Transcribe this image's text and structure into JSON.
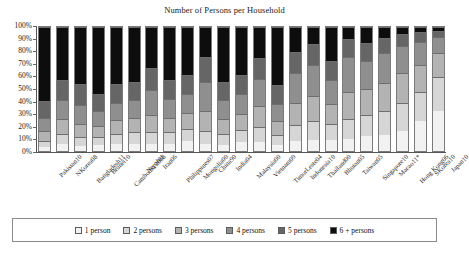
{
  "chart_data": {
    "type": "bar",
    "subtype": "stacked-100-percent",
    "title": "Number of Persons per Household",
    "xlabel": "",
    "ylabel": "",
    "ylim": [
      0,
      100
    ],
    "ytick_labels": [
      "0%",
      "10%",
      "20%",
      "30%",
      "40%",
      "50%",
      "60%",
      "70%",
      "80%",
      "90%",
      "100%"
    ],
    "ytick_values": [
      0,
      10,
      20,
      30,
      40,
      50,
      60,
      70,
      80,
      90,
      100
    ],
    "grid": false,
    "legend_position": "bottom",
    "categories": [
      "Pakistan10",
      "NKorea08",
      "Bangladesh11",
      "Brunei10",
      "Cambodia 2008",
      "Nepal01",
      "Iran06",
      "Philippines07",
      "Mongolia00",
      "China90",
      "India04",
      "Malaysia00",
      "Vietnam09",
      "TimorLeste04",
      "Indonesia10",
      "Thailand00",
      "Bhutan05",
      "Taiwan05",
      "Singapore10",
      "Macao11*",
      "Hong Kong06",
      "SKorea10",
      "Japan10"
    ],
    "series": [
      {
        "name": "1 person",
        "color": "#f2f2f2",
        "values": [
          3,
          6,
          4,
          5,
          6,
          6,
          6,
          6,
          8,
          6,
          5,
          7,
          7,
          5,
          8,
          9,
          9,
          10,
          12,
          13,
          16,
          24,
          32
        ]
      },
      {
        "name": "2 persons",
        "color": "#d6d6d6",
        "values": [
          5,
          8,
          7,
          6,
          8,
          9,
          9,
          9,
          10,
          10,
          9,
          10,
          12,
          8,
          13,
          15,
          13,
          16,
          17,
          19,
          23,
          24,
          28
        ]
      },
      {
        "name": "3 persons",
        "color": "#b3b3b3",
        "values": [
          8,
          12,
          11,
          9,
          11,
          12,
          14,
          12,
          13,
          16,
          12,
          13,
          17,
          11,
          18,
          20,
          16,
          22,
          21,
          23,
          24,
          21,
          19
        ]
      },
      {
        "name": "4 persons",
        "color": "#8f8f8f",
        "values": [
          11,
          15,
          15,
          12,
          14,
          14,
          20,
          15,
          15,
          24,
          15,
          16,
          22,
          14,
          24,
          25,
          19,
          28,
          23,
          24,
          22,
          19,
          13
        ]
      },
      {
        "name": "5 persons",
        "color": "#666666",
        "values": [
          13,
          16,
          17,
          14,
          15,
          15,
          18,
          15,
          15,
          20,
          15,
          15,
          17,
          15,
          17,
          17,
          16,
          14,
          14,
          12,
          9,
          8,
          5
        ]
      },
      {
        "name": "6 + persons",
        "color": "#0d0d0d",
        "values": [
          60,
          43,
          46,
          54,
          46,
          44,
          33,
          43,
          39,
          24,
          44,
          39,
          25,
          47,
          20,
          14,
          27,
          10,
          13,
          9,
          6,
          4,
          3
        ]
      }
    ],
    "legend_entries": [
      {
        "label": "1 person",
        "color": "#f2f2f2"
      },
      {
        "label": "2 persons",
        "color": "#d6d6d6"
      },
      {
        "label": "3 persons",
        "color": "#b3b3b3"
      },
      {
        "label": "4 persons",
        "color": "#8f8f8f"
      },
      {
        "label": "5 persons",
        "color": "#666666"
      },
      {
        "label": "6 + persons",
        "color": "#0d0d0d"
      }
    ]
  }
}
